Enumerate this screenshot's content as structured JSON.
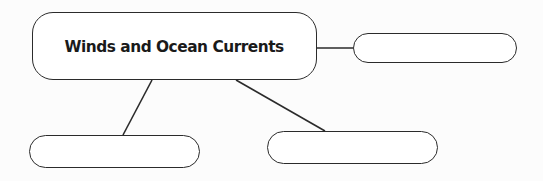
{
  "diagram": {
    "type": "concept-map",
    "main_node": {
      "label": "Winds and Ocean Currents"
    },
    "empty_nodes": [
      {
        "position": "right",
        "label": ""
      },
      {
        "position": "bottom-left",
        "label": ""
      },
      {
        "position": "bottom-right",
        "label": ""
      }
    ],
    "connections": [
      {
        "from": "main",
        "to": "right"
      },
      {
        "from": "main",
        "to": "bottom-left"
      },
      {
        "from": "main",
        "to": "bottom-right"
      }
    ]
  },
  "colors": {
    "stroke": "#2b2b2b",
    "node_fill": "#ffffff",
    "background": "#fcfcfc",
    "text": "#1a1a1a"
  }
}
